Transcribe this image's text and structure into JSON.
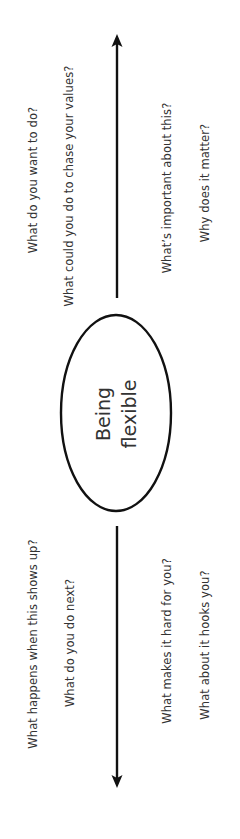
{
  "diagram": {
    "center": {
      "line1": "Being",
      "line2": "flexible"
    },
    "upper": {
      "direction": "toward",
      "questions_left": [
        "What do you want to do?",
        "What could you do to chase your values?"
      ],
      "questions_right": [
        "What’s important about this?",
        "Why does it matter?"
      ]
    },
    "lower": {
      "direction": "away",
      "questions_left": [
        "What happens when this shows up?",
        "What do you do next?"
      ],
      "questions_right": [
        "What makes it hard for you?",
        "What about it hooks you?"
      ]
    },
    "colors": {
      "stroke": "#111111",
      "text": "#333333",
      "background": "#ffffff"
    }
  }
}
